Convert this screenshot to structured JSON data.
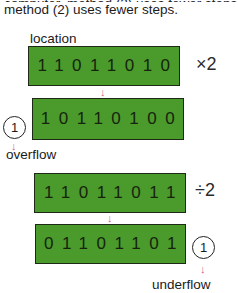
{
  "intro": {
    "line1_partial": "computer, method (2) uses fewer steps.",
    "line2": "method (2) uses fewer steps."
  },
  "location_label": "location",
  "registers": [
    {
      "bits": "11011010",
      "operation": "×2"
    },
    {
      "bits": "10110100",
      "operation": ""
    },
    {
      "bits": "11011011",
      "operation": "÷2"
    },
    {
      "bits": "01101101",
      "operation": ""
    }
  ],
  "overflow": {
    "bit": "1",
    "label": "overflow"
  },
  "underflow": {
    "bit": "1",
    "label": "underflow"
  },
  "colors": {
    "register_green": "#4b9a2c",
    "arrow_pink": "#d8607a",
    "digit_dark": "#15240c"
  }
}
